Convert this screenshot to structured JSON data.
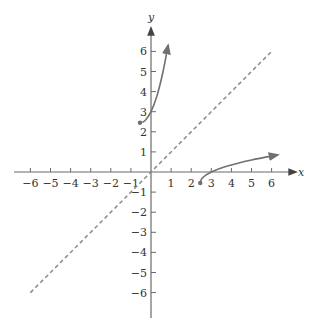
{
  "chart_data": {
    "type": "line",
    "title": "",
    "xlabel": "x",
    "ylabel": "y",
    "xlim": [
      -6,
      6
    ],
    "ylim": [
      -6,
      6
    ],
    "grid": false,
    "x_ticks": [
      -6,
      -5,
      -4,
      -3,
      -2,
      -1,
      1,
      2,
      3,
      4,
      5,
      6
    ],
    "y_ticks": [
      -6,
      -5,
      -4,
      -3,
      -2,
      -1,
      1,
      2,
      3,
      4,
      5,
      6
    ],
    "x_tick_labels": [
      "−6",
      "−5",
      "−4",
      "−3",
      "−2",
      "−1",
      "1",
      "2",
      "3",
      "4",
      "5",
      "6"
    ],
    "y_tick_labels": [
      "−6",
      "−5",
      "−4",
      "−3",
      "−2",
      "−1",
      "1",
      "2",
      "3",
      "4",
      "5",
      "6"
    ],
    "series": [
      {
        "name": "f",
        "style": "solid",
        "start": "closed-dot",
        "end": "arrow",
        "points": [
          [
            -0.55,
            2.45
          ],
          [
            -0.3,
            2.55
          ],
          [
            0,
            3.0
          ],
          [
            0.3,
            3.8
          ],
          [
            0.6,
            5.0
          ],
          [
            0.85,
            6.3
          ]
        ]
      },
      {
        "name": "f-inverse",
        "style": "solid",
        "start": "closed-dot",
        "end": "arrow",
        "points": [
          [
            2.45,
            -0.55
          ],
          [
            2.55,
            -0.3
          ],
          [
            3.0,
            0
          ],
          [
            3.8,
            0.3
          ],
          [
            5.0,
            0.6
          ],
          [
            6.3,
            0.85
          ]
        ]
      },
      {
        "name": "y = x",
        "style": "dashed",
        "points": [
          [
            -6,
            -6
          ],
          [
            6,
            6
          ]
        ]
      }
    ]
  },
  "labels": {
    "x_axis": "x",
    "y_axis": "y"
  },
  "colors": {
    "axis": "#6b6b6b",
    "curve": "#707070",
    "dashed": "#8a8a8a",
    "text": "#333333"
  }
}
